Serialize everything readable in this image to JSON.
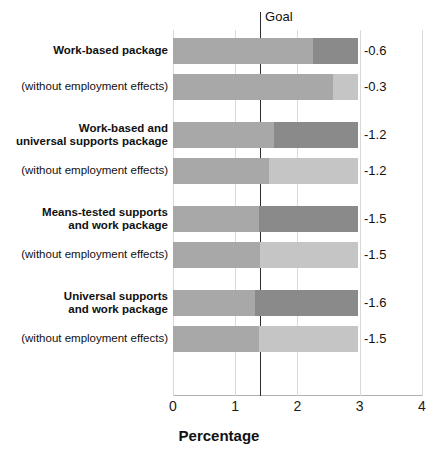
{
  "chart_data": {
    "type": "bar",
    "orientation": "horizontal",
    "title": "",
    "subtitle": "",
    "xlabel": "Percentage",
    "ylabel": "",
    "xlim": [
      0,
      4
    ],
    "ylim": null,
    "grid": true,
    "legend": false,
    "legend_position": "none",
    "xticks": [
      0,
      1,
      2,
      3,
      4
    ],
    "xtick_labels": [
      "0",
      "1",
      "2",
      "3",
      "4"
    ],
    "annotations": [
      {
        "name": "goal-line",
        "label": "Goal",
        "value": 1.4
      }
    ],
    "groups": [
      {
        "name": "work-based-package",
        "bars": [
          {
            "label": "Work-based package",
            "is_sub": false,
            "value_label": "-0.6",
            "total": 2.97,
            "segments": [
              {
                "name": "base",
                "start": 0.0,
                "end": 2.25,
                "color": "#a8a8a8"
              },
              {
                "name": "extra",
                "start": 2.25,
                "end": 2.97,
                "color": "#8a8a8a"
              }
            ]
          },
          {
            "label": "(without employment effects)",
            "is_sub": true,
            "value_label": "-0.3",
            "total": 2.97,
            "segments": [
              {
                "name": "base",
                "start": 0.0,
                "end": 2.57,
                "color": "#a8a8a8"
              },
              {
                "name": "extra",
                "start": 2.57,
                "end": 2.97,
                "color": "#c5c5c5"
              }
            ]
          }
        ]
      },
      {
        "name": "work-based-and-universal-supports-package",
        "bars": [
          {
            "label": "Work-based and\nuniversal supports package",
            "is_sub": false,
            "value_label": "-1.2",
            "total": 2.97,
            "segments": [
              {
                "name": "base",
                "start": 0.0,
                "end": 1.62,
                "color": "#a8a8a8"
              },
              {
                "name": "extra",
                "start": 1.62,
                "end": 2.97,
                "color": "#8a8a8a"
              }
            ]
          },
          {
            "label": "(without employment effects)",
            "is_sub": true,
            "value_label": "-1.2",
            "total": 2.97,
            "segments": [
              {
                "name": "base",
                "start": 0.0,
                "end": 1.54,
                "color": "#a8a8a8"
              },
              {
                "name": "extra",
                "start": 1.54,
                "end": 2.97,
                "color": "#c5c5c5"
              }
            ]
          }
        ]
      },
      {
        "name": "means-tested-supports-and-work-package",
        "bars": [
          {
            "label": "Means-tested supports\nand work package",
            "is_sub": false,
            "value_label": "-1.5",
            "total": 2.97,
            "segments": [
              {
                "name": "base",
                "start": 0.0,
                "end": 1.38,
                "color": "#a8a8a8"
              },
              {
                "name": "extra",
                "start": 1.38,
                "end": 2.97,
                "color": "#8a8a8a"
              }
            ]
          },
          {
            "label": "(without employment effects)",
            "is_sub": true,
            "value_label": "-1.5",
            "total": 2.97,
            "segments": [
              {
                "name": "base",
                "start": 0.0,
                "end": 1.4,
                "color": "#a8a8a8"
              },
              {
                "name": "extra",
                "start": 1.4,
                "end": 2.97,
                "color": "#c5c5c5"
              }
            ]
          }
        ]
      },
      {
        "name": "universal-supports-and-work-package",
        "bars": [
          {
            "label": "Universal supports\nand work package",
            "is_sub": false,
            "value_label": "-1.6",
            "total": 2.97,
            "segments": [
              {
                "name": "base",
                "start": 0.0,
                "end": 1.32,
                "color": "#a8a8a8"
              },
              {
                "name": "extra",
                "start": 1.32,
                "end": 2.97,
                "color": "#8a8a8a"
              }
            ]
          },
          {
            "label": "(without employment effects)",
            "is_sub": true,
            "value_label": "-1.5",
            "total": 2.97,
            "segments": [
              {
                "name": "base",
                "start": 0.0,
                "end": 1.38,
                "color": "#a8a8a8"
              },
              {
                "name": "extra",
                "start": 1.38,
                "end": 2.97,
                "color": "#c5c5c5"
              }
            ]
          }
        ]
      }
    ]
  },
  "colors": {
    "segment_base": "#a8a8a8",
    "segment_dark": "#8a8a8a",
    "segment_light": "#c5c5c5",
    "goal_line": "#2b2b2b",
    "gridline": "#d9d9d9",
    "text": "#111111"
  }
}
